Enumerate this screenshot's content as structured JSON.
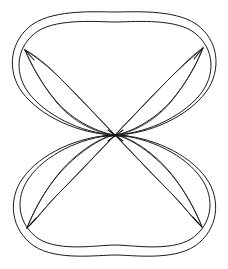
{
  "figure": {
    "title": "Symmetric figure-eight curve diagram",
    "background_color": "#ffffff",
    "stroke_color": "#1a1a1a",
    "canvas": {
      "width": 228,
      "height": 269
    },
    "center": {
      "x": 115,
      "y": 135
    },
    "nodes": [
      {
        "name": "top-left-node",
        "x": 25,
        "y": 50
      },
      {
        "name": "top-right-node",
        "x": 203,
        "y": 48
      },
      {
        "name": "bottom-left-node",
        "x": 27,
        "y": 228
      },
      {
        "name": "bottom-right-node",
        "x": 202,
        "y": 227
      }
    ],
    "extents": {
      "top_outer_y": 12,
      "top_inner_y": 22,
      "bottom_outer_y": 255,
      "bottom_inner_y": 245,
      "left_outer_x": 9,
      "right_outer_x": 217
    },
    "lobes": [
      {
        "name": "upper-lobe",
        "top": 12,
        "bottom": 135
      },
      {
        "name": "lower-lobe",
        "top": 135,
        "bottom": 255
      }
    ],
    "petals": [
      {
        "name": "upper-left-petal",
        "from": "center",
        "to": "top-left-node"
      },
      {
        "name": "upper-right-petal",
        "from": "center",
        "to": "top-right-node"
      },
      {
        "name": "lower-left-petal",
        "from": "center",
        "to": "bottom-left-node"
      },
      {
        "name": "lower-right-petal",
        "from": "center",
        "to": "bottom-right-node"
      }
    ],
    "line_count": 16,
    "symmetry": "4-fold mirror symmetry (vertical and horizontal axes)"
  }
}
